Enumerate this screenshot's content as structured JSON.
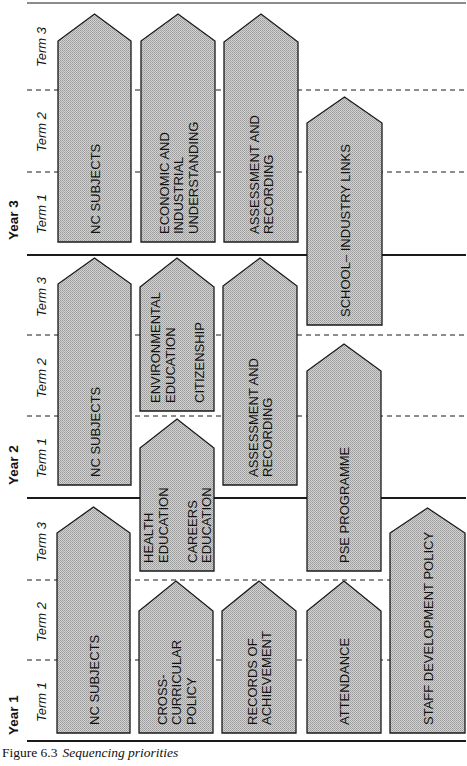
{
  "figure": {
    "number": "Figure 6.3",
    "title": "Sequencing priorities"
  },
  "colors": {
    "box_fill": "#c8c8c8",
    "box_stroke": "#1a1a1a",
    "line": "#1a1a1a",
    "background": "#ffffff"
  },
  "axis": {
    "years": [
      {
        "label": "Year 3",
        "y_center": 218
      },
      {
        "label": "Year 2",
        "y_center": 463
      },
      {
        "label": "Year 1",
        "y_center": 713
      }
    ],
    "terms": [
      {
        "label": "Term 3",
        "y": 45
      },
      {
        "label": "Term 2",
        "y": 130
      },
      {
        "label": "Term 1",
        "y": 212
      },
      {
        "label": "Term 3",
        "y": 295
      },
      {
        "label": "Term 2",
        "y": 376
      },
      {
        "label": "Term 1",
        "y": 456
      },
      {
        "label": "Term 3",
        "y": 540
      },
      {
        "label": "Term 2",
        "y": 620
      },
      {
        "label": "Term 1",
        "y": 700
      }
    ],
    "solid_lines_y": [
      3,
      255,
      498,
      741
    ],
    "dashed_lines_y": [
      90,
      172,
      335,
      416,
      580,
      660
    ]
  },
  "boxes": [
    {
      "id": "y3-nc-subjects",
      "lines": [
        "NC SUBJECTS"
      ],
      "x": 58,
      "w": 73,
      "peak": 14,
      "shoulder": 41,
      "bottom": 242
    },
    {
      "id": "y3-economic-industrial",
      "lines": [
        "ECONOMIC AND",
        "INDUSTRIAL",
        "UNDERSTANDING"
      ],
      "x": 141,
      "w": 74,
      "peak": 14,
      "shoulder": 41,
      "bottom": 242
    },
    {
      "id": "y3-assessment",
      "lines": [
        "ASSESSMENT AND",
        "RECORDING"
      ],
      "x": 224,
      "w": 74,
      "peak": 14,
      "shoulder": 42,
      "bottom": 242
    },
    {
      "id": "school-industry-links",
      "lines": [
        "SCHOOL– INDUSTRY LINKS"
      ],
      "x": 307,
      "w": 75,
      "peak": 97,
      "shoulder": 123,
      "bottom": 325
    },
    {
      "id": "y2-nc-subjects",
      "lines": [
        "NC SUBJECTS"
      ],
      "x": 58,
      "w": 73,
      "peak": 258,
      "shoulder": 284,
      "bottom": 485
    },
    {
      "id": "environmental-citizenship",
      "lines": [
        "ENVIRONMENTAL",
        "EDUCATION",
        "",
        "CITIZENSHIP"
      ],
      "x": 140,
      "w": 74,
      "peak": 258,
      "shoulder": 287,
      "bottom": 411
    },
    {
      "id": "y2-assessment",
      "lines": [
        "ASSESSMENT AND",
        "RECORDING"
      ],
      "x": 223,
      "w": 74,
      "peak": 258,
      "shoulder": 286,
      "bottom": 485
    },
    {
      "id": "pse-programme",
      "lines": [
        "PSE PROGRAMME"
      ],
      "x": 307,
      "w": 74,
      "peak": 344,
      "shoulder": 371,
      "bottom": 571
    },
    {
      "id": "health-careers",
      "lines": [
        "HEALTH",
        "EDUCATION",
        "",
        "CAREERS",
        "EDUCATION"
      ],
      "x": 140,
      "w": 74,
      "peak": 419,
      "shoulder": 448,
      "bottom": 571
    },
    {
      "id": "y1-nc-subjects",
      "lines": [
        "NC SUBJECTS"
      ],
      "x": 57,
      "w": 73,
      "peak": 507,
      "shoulder": 533,
      "bottom": 733
    },
    {
      "id": "cross-curricular-policy",
      "lines": [
        "CROSS-",
        "CURRICULAR",
        "POLICY"
      ],
      "x": 139,
      "w": 74,
      "peak": 581,
      "shoulder": 611,
      "bottom": 733
    },
    {
      "id": "records-of-achievement",
      "lines": [
        "RECORDS OF",
        "ACHIEVEMENT"
      ],
      "x": 222,
      "w": 74,
      "peak": 581,
      "shoulder": 611,
      "bottom": 733
    },
    {
      "id": "attendance",
      "lines": [
        "ATTENDANCE"
      ],
      "x": 307,
      "w": 74,
      "peak": 581,
      "shoulder": 611,
      "bottom": 733
    },
    {
      "id": "staff-development-policy",
      "lines": [
        "STAFF DEVELOPMENT POLICY"
      ],
      "x": 390,
      "w": 75,
      "peak": 508,
      "shoulder": 533,
      "bottom": 733
    }
  ]
}
